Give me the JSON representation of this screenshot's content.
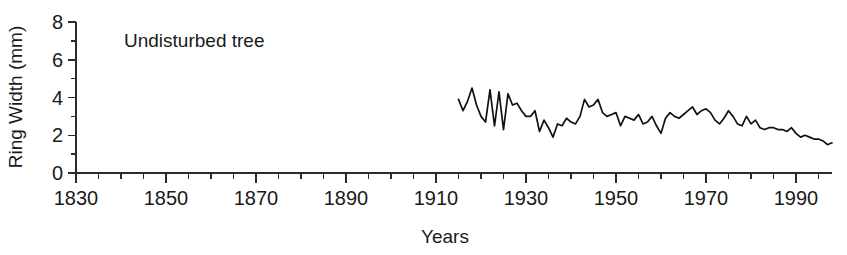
{
  "chart_data": {
    "type": "line",
    "title": "",
    "xlabel": "Years",
    "ylabel": "Ring Width (mm)",
    "xlim": [
      1830,
      1998
    ],
    "ylim": [
      0,
      8
    ],
    "grid": false,
    "legend": null,
    "x_major_ticks": [
      1830,
      1850,
      1870,
      1890,
      1910,
      1930,
      1950,
      1970,
      1990
    ],
    "x_major_tick_labels": [
      "1830",
      "1850",
      "1870",
      "1890",
      "1910",
      "1930",
      "1950",
      "1970",
      "1990"
    ],
    "x_minor_tick_interval": 5,
    "y_major_ticks": [
      0,
      2,
      4,
      6,
      8
    ],
    "y_major_tick_labels": [
      "0",
      "2",
      "4",
      "6",
      "8"
    ],
    "y_minor_ticks": [
      1,
      3,
      5,
      7
    ],
    "annotations": [
      {
        "text": "Undisturbed tree",
        "x": 1848,
        "y": 7.0
      }
    ],
    "series": [
      {
        "name": "Undisturbed tree ring width",
        "color": "#111111",
        "x": [
          1915,
          1916,
          1917,
          1918,
          1919,
          1920,
          1921,
          1922,
          1923,
          1924,
          1925,
          1926,
          1927,
          1928,
          1929,
          1930,
          1931,
          1932,
          1933,
          1934,
          1935,
          1936,
          1937,
          1938,
          1939,
          1940,
          1941,
          1942,
          1943,
          1944,
          1945,
          1946,
          1947,
          1948,
          1949,
          1950,
          1951,
          1952,
          1953,
          1954,
          1955,
          1956,
          1957,
          1958,
          1959,
          1960,
          1961,
          1962,
          1963,
          1964,
          1965,
          1966,
          1967,
          1968,
          1969,
          1970,
          1971,
          1972,
          1973,
          1974,
          1975,
          1976,
          1977,
          1978,
          1979,
          1980,
          1981,
          1982,
          1983,
          1984,
          1985,
          1986,
          1987,
          1988,
          1989,
          1990,
          1991,
          1992,
          1993,
          1994,
          1995,
          1996,
          1997,
          1998
        ],
        "values": [
          3.9,
          3.3,
          3.8,
          4.5,
          3.6,
          3.0,
          2.7,
          4.4,
          2.5,
          4.3,
          2.3,
          4.2,
          3.6,
          3.7,
          3.3,
          3.0,
          3.0,
          3.3,
          2.2,
          2.8,
          2.4,
          1.9,
          2.6,
          2.5,
          2.9,
          2.7,
          2.6,
          3.0,
          3.9,
          3.5,
          3.6,
          3.9,
          3.2,
          3.0,
          3.1,
          3.2,
          2.5,
          3.0,
          2.9,
          2.8,
          3.1,
          2.6,
          2.7,
          3.0,
          2.5,
          2.1,
          2.9,
          3.2,
          3.0,
          2.9,
          3.1,
          3.3,
          3.5,
          3.1,
          3.3,
          3.4,
          3.2,
          2.8,
          2.6,
          2.9,
          3.3,
          3.0,
          2.6,
          2.5,
          3.0,
          2.6,
          2.8,
          2.4,
          2.3,
          2.4,
          2.4,
          2.3,
          2.3,
          2.2,
          2.4,
          2.1,
          1.9,
          2.0,
          1.9,
          1.8,
          1.8,
          1.7,
          1.5,
          1.6
        ]
      }
    ]
  },
  "labels": {
    "y_axis_title": "Ring Width (mm)",
    "x_axis_title": "Years",
    "annotation": "Undisturbed tree"
  }
}
